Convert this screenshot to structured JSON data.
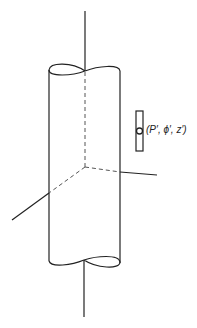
{
  "figure": {
    "point_label": "(P′, ϕ′, z′)",
    "stroke_color": "#222222",
    "dash_color": "#555555"
  }
}
